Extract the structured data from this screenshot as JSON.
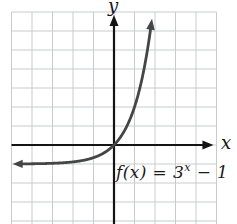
{
  "figure": {
    "y_axis_label": "y",
    "x_axis_label": "x",
    "equation_full": "f(x) = 3^x − 1",
    "equation": {
      "prefix": "f(x) = 3",
      "superscript": "x",
      "suffix": " − 1"
    }
  },
  "colors": {
    "background": "#ffffff",
    "grid": "#c7cbce",
    "axis": "#141414",
    "curve": "#454545",
    "text": "#141414"
  },
  "chart_data": {
    "type": "line",
    "title": "",
    "xlabel": "x",
    "ylabel": "y",
    "equation_label": "f(x) = 3^x − 1",
    "series": [
      {
        "name": "f(x) = 3^x − 1",
        "formula": "3^x − 1",
        "base": 3,
        "offset": -1,
        "x_drawn_range": [
          -4.6,
          1.8
        ],
        "sample_step": 0.02
      }
    ],
    "horizontal_asymptote_y": -1,
    "key_points": [
      {
        "x": -2,
        "y": -0.889
      },
      {
        "x": -1,
        "y": -0.667
      },
      {
        "x": 0,
        "y": 0
      },
      {
        "x": 1,
        "y": 2
      }
    ],
    "xlim": [
      -5.07,
      5.12
    ],
    "ylim": [
      -4.16,
      6.84
    ],
    "grid": true,
    "grid_step": 1,
    "legend": "none"
  }
}
